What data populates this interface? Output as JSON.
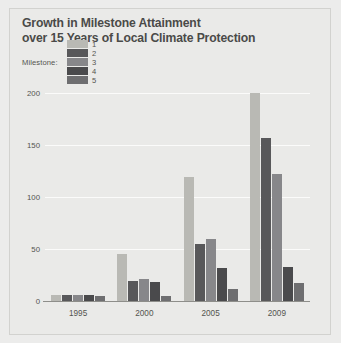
{
  "figure": {
    "background_color": "#eaeae8",
    "frame_border_color": "#d2d2cf"
  },
  "title": {
    "line1": "Growth in Milestone Attainment",
    "line2": "over 15 Years of Local Climate Protection"
  },
  "legend": {
    "title": "Milestone:",
    "items": [
      {
        "label": "1",
        "color": "#b9b9b4"
      },
      {
        "label": "2",
        "color": "#58585a"
      },
      {
        "label": "3",
        "color": "#87878a"
      },
      {
        "label": "4",
        "color": "#4a4a4c"
      },
      {
        "label": "5",
        "color": "#6e6e70"
      }
    ]
  },
  "chart_data": {
    "type": "bar",
    "title": "Growth in Milestone Attainment over 15 Years of Local Climate Protection",
    "xlabel": "",
    "ylabel": "",
    "categories": [
      "1995",
      "2000",
      "2005",
      "2009"
    ],
    "series": [
      {
        "name": "1",
        "color": "#b9b9b4",
        "values": [
          6,
          45,
          119,
          200
        ]
      },
      {
        "name": "2",
        "color": "#58585a",
        "values": [
          6,
          19,
          55,
          157
        ]
      },
      {
        "name": "3",
        "color": "#87878a",
        "values": [
          6,
          21,
          60,
          122
        ]
      },
      {
        "name": "4",
        "color": "#4a4a4c",
        "values": [
          6,
          18,
          32,
          33
        ]
      },
      {
        "name": "5",
        "color": "#6e6e70",
        "values": [
          5,
          5,
          12,
          17
        ]
      }
    ],
    "ylim": [
      0,
      210
    ],
    "yticks": [
      "0",
      "50",
      "100",
      "150",
      "200"
    ],
    "ytick_values": [
      0,
      50,
      100,
      150,
      200
    ],
    "grid": true,
    "gridline_color": "#fbfbfa",
    "legend_position": "top-left",
    "axis_line_color": "#8e8e8a"
  }
}
